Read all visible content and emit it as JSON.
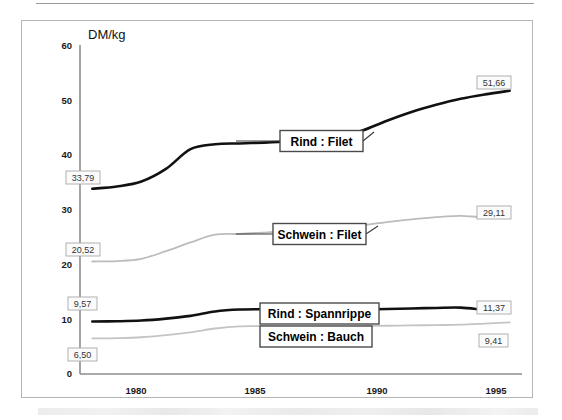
{
  "figure": {
    "unit_label": "DM/kg"
  },
  "chart_data": {
    "type": "line",
    "title": "",
    "subtitle": "",
    "xlabel": "",
    "ylabel": "DM/kg",
    "xlim": [
      1977.5,
      1995.5
    ],
    "ylim": [
      0,
      60
    ],
    "yticks": [
      0,
      10,
      20,
      30,
      40,
      50,
      60
    ],
    "ytick_labels": [
      "0",
      "10",
      "20",
      "30",
      "40",
      "50",
      "60"
    ],
    "xticks": [
      1980,
      1985,
      1990,
      1995
    ],
    "xtick_labels": [
      "1980",
      "1985",
      "1990",
      "1995"
    ],
    "grid": false,
    "legend_position": "inline-callouts",
    "x": [
      1978,
      1979,
      1980,
      1981,
      1982,
      1983,
      1984,
      1985,
      1986,
      1987,
      1988,
      1989,
      1990,
      1991,
      1992,
      1993,
      1994,
      1995
    ],
    "series": [
      {
        "name": "Rind : Filet",
        "color": "#111111",
        "width": 2.6,
        "start_value": "33,79",
        "end_value": "51,66",
        "values": [
          33.79,
          34.2,
          35.1,
          37.4,
          41.0,
          41.9,
          42.05,
          42.2,
          42.4,
          42.7,
          43.1,
          44.4,
          46.2,
          47.8,
          49.1,
          50.2,
          51.0,
          51.66
        ]
      },
      {
        "name": "Schwein : Filet",
        "color": "#bcbcbc",
        "width": 1.8,
        "start_value": "20,52",
        "end_value": "29,11",
        "values": [
          20.52,
          20.6,
          21.0,
          22.4,
          24.0,
          25.4,
          25.55,
          25.8,
          26.1,
          26.4,
          26.6,
          27.1,
          27.7,
          28.2,
          28.6,
          28.85,
          28.6,
          29.11
        ]
      },
      {
        "name": "Rind : Spannrippe",
        "color": "#111111",
        "width": 2.6,
        "start_value": "9,57",
        "end_value": "11,37",
        "values": [
          9.57,
          9.62,
          9.75,
          10.1,
          10.6,
          11.4,
          11.75,
          11.8,
          11.78,
          11.72,
          11.7,
          11.75,
          11.85,
          11.95,
          12.05,
          12.1,
          11.7,
          11.37
        ]
      },
      {
        "name": "Schwein : Bauch",
        "color": "#c4c4c4",
        "width": 1.8,
        "start_value": "6,50",
        "end_value": "9,41",
        "values": [
          6.5,
          6.55,
          6.7,
          7.1,
          7.6,
          8.3,
          8.7,
          8.72,
          8.62,
          8.65,
          8.68,
          8.72,
          8.8,
          8.86,
          8.92,
          9.0,
          9.2,
          9.41
        ]
      }
    ],
    "callouts": [
      {
        "label": "Rind : Filet"
      },
      {
        "label": "Schwein : Filet"
      },
      {
        "label": "Rind : Spannrippe"
      },
      {
        "label": "Schwein : Bauch"
      }
    ],
    "endpoint_labels": [
      "33,79",
      "20,52",
      "9,57",
      "6,50",
      "51,66",
      "29,11",
      "11,37",
      "9,41"
    ]
  }
}
